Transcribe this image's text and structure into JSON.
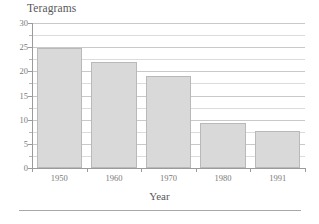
{
  "chart_data": {
    "type": "bar",
    "title": "Teragrams",
    "xlabel": "Year",
    "ylabel": "",
    "categories": [
      "1950",
      "1960",
      "1970",
      "1980",
      "1991"
    ],
    "values": [
      24.8,
      22.0,
      19.0,
      9.3,
      7.7
    ],
    "ylim": [
      0,
      30
    ],
    "ytick_labels": [
      "0",
      "5",
      "10",
      "15",
      "20",
      "25",
      "30"
    ],
    "ytick_values": [
      0,
      5,
      10,
      15,
      20,
      25,
      30
    ],
    "minor_tick_values": [
      2.5,
      7.5,
      12.5,
      17.5,
      22.5,
      27.5
    ],
    "grid": true,
    "grid_axis": "y",
    "legend": "none",
    "bar_fill_color": "#d9d9d9",
    "bar_edge_color": "#b9b9b9",
    "gridline_color": "#c9c9c9",
    "axis_color": "#9b9b9b",
    "text_color": "#6e6e6e"
  }
}
